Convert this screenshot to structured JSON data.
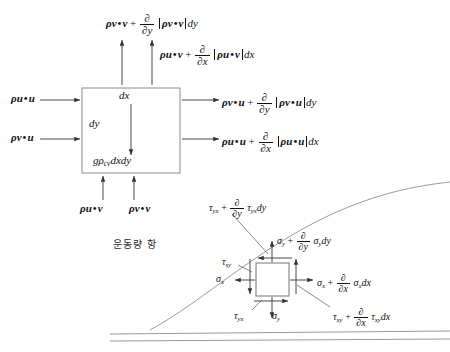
{
  "figure": {
    "korean_note": "운동량 항",
    "control_volume": {
      "inner_dx": "dx",
      "inner_dy": "dy",
      "body_force": {
        "g": "g",
        "rho": "ρ",
        "sub": "cv",
        "area": "dxdy"
      }
    },
    "flux_labels": {
      "top_left": {
        "base_rho": "ρ",
        "base_v1": "v",
        "base_v2": "v",
        "op": "+",
        "num": "∂",
        "den": "∂y",
        "br_rho": "ρ",
        "br_v1": "v",
        "br_v2": "v",
        "diff": "dy"
      },
      "top_right": {
        "base_rho": "ρ",
        "base_v1": "u",
        "base_v2": "v",
        "op": "+",
        "num": "∂",
        "den": "∂x",
        "br_rho": "ρ",
        "br_v1": "u",
        "br_v2": "v",
        "diff": "dx"
      },
      "left_upper": {
        "rho": "ρ",
        "v1": "u",
        "v2": "u"
      },
      "left_lower": {
        "rho": "ρ",
        "v1": "v",
        "v2": "u"
      },
      "bottom_left": {
        "rho": "ρ",
        "v1": "u",
        "v2": "v"
      },
      "bottom_right": {
        "rho": "ρ",
        "v1": "v",
        "v2": "v"
      },
      "right_upper": {
        "base_rho": "ρ",
        "base_v1": "v",
        "base_v2": "u",
        "op": "+",
        "num": "∂",
        "den": "∂y",
        "br_rho": "ρ",
        "br_v1": "v",
        "br_v2": "u",
        "diff": "dy"
      },
      "right_lower": {
        "base_rho": "ρ",
        "base_v1": "u",
        "base_v2": "u",
        "op": "+",
        "num": "∂",
        "den": "∂x",
        "br_rho": "ρ",
        "br_v1": "u",
        "br_v2": "u",
        "diff": "dx"
      }
    },
    "stress_element": {
      "tau_yx_top": {
        "sym": "τ",
        "sub": "yx",
        "op": "+",
        "num": "∂",
        "den": "∂y",
        "t2": "τ",
        "t2sub": "yx",
        "diff": "dy"
      },
      "sigma_y_top": {
        "sym": "σ",
        "sub": "y",
        "op": "+",
        "num": "∂",
        "den": "∂y",
        "t2": "σ",
        "t2sub": "y",
        "diff": "dy"
      },
      "sigma_x_right": {
        "sym": "σ",
        "sub": "x",
        "op": "+",
        "num": "∂",
        "den": "∂x",
        "t2": "σ",
        "t2sub": "x",
        "diff": "dx"
      },
      "tau_xy_right": {
        "sym": "τ",
        "sub": "xy",
        "op": "+",
        "num": "∂",
        "den": "∂x",
        "t2": "τ",
        "t2sub": "xy",
        "diff": "dx"
      },
      "tau_sy_left": {
        "sym": "τ",
        "sub": "sy"
      },
      "sigma_x_left": {
        "sym": "σ",
        "sub": "x"
      },
      "tau_yx_bottom": {
        "sym": "τ",
        "sub": "yx"
      },
      "sigma_y_bottom": {
        "sym": "σ",
        "sub": "y"
      }
    }
  },
  "colors": {
    "stroke": "#444444",
    "box_stroke": "#888888",
    "curve": "#9a9a9a",
    "text": "#111111"
  }
}
